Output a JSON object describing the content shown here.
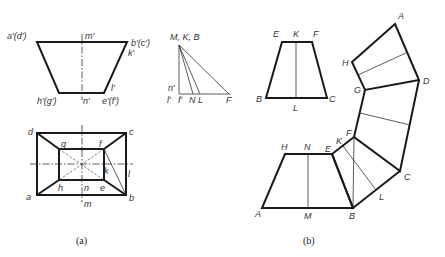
{
  "figure": {
    "panels": [
      {
        "id": "a",
        "caption": "(a)",
        "front_view": {
          "labels": {
            "a_d": "a'(d')",
            "m": "m'",
            "b_c": "b'(c')",
            "k": "k'",
            "l": "l'",
            "h_g": "h'(g')",
            "n": "n'",
            "e_f": "e'(f')"
          }
        },
        "top_view": {
          "labels": {
            "d": "d",
            "c": "c",
            "g": "g",
            "f": "f",
            "k": "k",
            "l": "l",
            "h": "h",
            "n": "n",
            "e": "e",
            "a": "a",
            "b": "b",
            "m": "m"
          }
        },
        "true_length_diagram": {
          "labels": {
            "apex": "M, K, B",
            "n": "n'",
            "l": "l'",
            "f": "f'",
            "N": "N",
            "L": "L",
            "F": "F"
          }
        }
      },
      {
        "id": "b",
        "caption": "(b)",
        "face_true_shape": {
          "labels": {
            "E": "E",
            "K": "K",
            "F": "F",
            "B": "B",
            "L": "L",
            "C": "C"
          }
        },
        "development": {
          "labels": {
            "A_top": "A",
            "H_top": "H",
            "D": "D",
            "G": "G",
            "F": "F",
            "K": "K",
            "E": "E",
            "C": "C",
            "L": "L",
            "H": "H",
            "N": "N",
            "A": "A",
            "M": "M",
            "B": "B"
          }
        }
      }
    ]
  }
}
